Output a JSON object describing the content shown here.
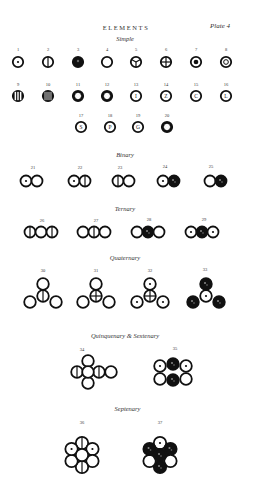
{
  "plate": {
    "title": "ELEMENTS",
    "plate_label": "Plate 4"
  },
  "sections": {
    "simple": "Simple",
    "binary": "Binary",
    "ternary": "Ternary",
    "quaternary": "Quaternary",
    "quinquenary_sextenary": "Quinquenary & Sextenary",
    "septenary": "Septenary"
  },
  "symbols": [
    {
      "n": "1",
      "kind": "dot-center"
    },
    {
      "n": "2",
      "kind": "vertical-line"
    },
    {
      "n": "3",
      "kind": "solid-black"
    },
    {
      "n": "4",
      "kind": "plain-circle"
    },
    {
      "n": "5",
      "kind": "three-spokes"
    },
    {
      "n": "6",
      "kind": "cross"
    },
    {
      "n": "7",
      "kind": "solid-inner-disc"
    },
    {
      "n": "8",
      "kind": "inner-ring"
    },
    {
      "n": "9",
      "kind": "two-vertical-lines"
    },
    {
      "n": "10",
      "kind": "three-vertical-lines"
    },
    {
      "n": "11",
      "kind": "star-cutout"
    },
    {
      "n": "12",
      "kind": "star-cutout"
    },
    {
      "n": "13",
      "kind": "letter",
      "letter": "I"
    },
    {
      "n": "14",
      "kind": "letter",
      "letter": "Z"
    },
    {
      "n": "15",
      "kind": "letter",
      "letter": "C"
    },
    {
      "n": "16",
      "kind": "letter",
      "letter": "L"
    },
    {
      "n": "17",
      "kind": "letter",
      "letter": "S"
    },
    {
      "n": "18",
      "kind": "letter",
      "letter": "P"
    },
    {
      "n": "19",
      "kind": "letter",
      "letter": "G"
    },
    {
      "n": "20",
      "kind": "star-cutout"
    },
    {
      "n": "21",
      "kind": "binary"
    },
    {
      "n": "22",
      "kind": "binary"
    },
    {
      "n": "23",
      "kind": "binary"
    },
    {
      "n": "24",
      "kind": "binary"
    },
    {
      "n": "25",
      "kind": "binary"
    },
    {
      "n": "26",
      "kind": "ternary"
    },
    {
      "n": "27",
      "kind": "ternary"
    },
    {
      "n": "28",
      "kind": "ternary"
    },
    {
      "n": "29",
      "kind": "ternary"
    },
    {
      "n": "30",
      "kind": "quaternary"
    },
    {
      "n": "31",
      "kind": "quaternary"
    },
    {
      "n": "32",
      "kind": "quaternary"
    },
    {
      "n": "33",
      "kind": "quaternary"
    },
    {
      "n": "34",
      "kind": "quinquenary"
    },
    {
      "n": "35",
      "kind": "sextenary"
    },
    {
      "n": "36",
      "kind": "septenary"
    },
    {
      "n": "37",
      "kind": "septenary"
    }
  ],
  "colors": {
    "ink": "#111111",
    "paper": "#ffffff",
    "caption": "#333333"
  }
}
